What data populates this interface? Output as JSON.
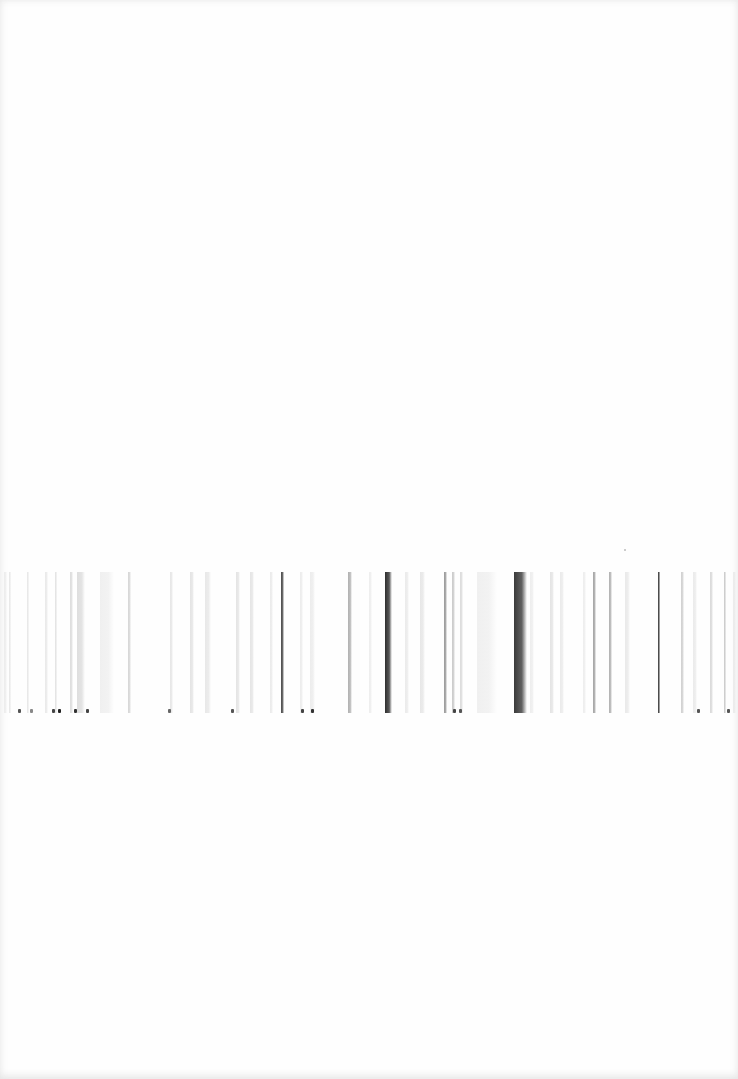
{
  "page": {
    "background": "#fefefe"
  },
  "strip": {
    "top": 572,
    "height": 141,
    "lines": [
      {
        "x": 4,
        "w": 3,
        "color": "#e6e6e6",
        "opacity": 0.7
      },
      {
        "x": 9,
        "w": 2,
        "color": "#d8d8d8",
        "opacity": 0.6
      },
      {
        "x": 27,
        "w": 2,
        "color": "#dcdcdc",
        "opacity": 0.7
      },
      {
        "x": 45,
        "w": 3,
        "color": "#e0e0e0",
        "opacity": 0.7
      },
      {
        "x": 55,
        "w": 2,
        "color": "#cfcfcf",
        "opacity": 0.6
      },
      {
        "x": 70,
        "w": 3,
        "color": "#d4d4d4",
        "opacity": 0.8
      },
      {
        "x": 77,
        "w": 8,
        "color": "#c8c8c8",
        "opacity": 0.6
      },
      {
        "x": 100,
        "w": 14,
        "color": "#eeeeee",
        "opacity": 0.9
      },
      {
        "x": 128,
        "w": 3,
        "color": "#cccccc",
        "opacity": 0.8
      },
      {
        "x": 170,
        "w": 3,
        "color": "#dcdcdc",
        "opacity": 0.7
      },
      {
        "x": 190,
        "w": 4,
        "color": "#d8d8d8",
        "opacity": 0.7
      },
      {
        "x": 205,
        "w": 6,
        "color": "#e2e2e2",
        "opacity": 0.8
      },
      {
        "x": 236,
        "w": 4,
        "color": "#dddddd",
        "opacity": 0.8
      },
      {
        "x": 250,
        "w": 4,
        "color": "#dadada",
        "opacity": 0.7
      },
      {
        "x": 270,
        "w": 3,
        "color": "#e2e2e2",
        "opacity": 0.7
      },
      {
        "x": 281,
        "w": 3,
        "color": "#4a4a4a",
        "opacity": 1.0
      },
      {
        "x": 300,
        "w": 3,
        "color": "#e4e4e4",
        "opacity": 0.7
      },
      {
        "x": 310,
        "w": 5,
        "color": "#e8e8e8",
        "opacity": 0.8
      },
      {
        "x": 348,
        "w": 4,
        "color": "#a8a8a8",
        "opacity": 0.9
      },
      {
        "x": 369,
        "w": 3,
        "color": "#e6e6e6",
        "opacity": 0.7
      },
      {
        "x": 385,
        "w": 7,
        "color": "#2e2e2e",
        "opacity": 1.0
      },
      {
        "x": 405,
        "w": 4,
        "color": "#e2e2e2",
        "opacity": 0.7
      },
      {
        "x": 420,
        "w": 5,
        "color": "#dddddd",
        "opacity": 0.7
      },
      {
        "x": 444,
        "w": 3,
        "color": "#8e8e8e",
        "opacity": 0.9
      },
      {
        "x": 452,
        "w": 3,
        "color": "#bdbdbd",
        "opacity": 0.8
      },
      {
        "x": 460,
        "w": 3,
        "color": "#cccccc",
        "opacity": 0.7
      },
      {
        "x": 477,
        "w": 20,
        "color": "#eeeeee",
        "opacity": 0.9
      },
      {
        "x": 514,
        "w": 13,
        "color": "#3a3a3a",
        "opacity": 1.0
      },
      {
        "x": 530,
        "w": 4,
        "color": "#e6e6e6",
        "opacity": 0.7
      },
      {
        "x": 550,
        "w": 4,
        "color": "#dddddd",
        "opacity": 0.8
      },
      {
        "x": 560,
        "w": 4,
        "color": "#e2e2e2",
        "opacity": 0.7
      },
      {
        "x": 583,
        "w": 3,
        "color": "#e6e6e6",
        "opacity": 0.7
      },
      {
        "x": 593,
        "w": 3,
        "color": "#9a9a9a",
        "opacity": 0.9
      },
      {
        "x": 609,
        "w": 3,
        "color": "#a8a8a8",
        "opacity": 0.9
      },
      {
        "x": 625,
        "w": 5,
        "color": "#e4e4e4",
        "opacity": 0.8
      },
      {
        "x": 658,
        "w": 2,
        "color": "#3c3c3c",
        "opacity": 1.0
      },
      {
        "x": 681,
        "w": 3,
        "color": "#c4c4c4",
        "opacity": 0.8
      },
      {
        "x": 693,
        "w": 4,
        "color": "#e2e2e2",
        "opacity": 0.7
      },
      {
        "x": 710,
        "w": 3,
        "color": "#d0d0d0",
        "opacity": 0.8
      },
      {
        "x": 724,
        "w": 2,
        "color": "#bcbcbc",
        "opacity": 0.8
      },
      {
        "x": 733,
        "w": 3,
        "color": "#e4e4e4",
        "opacity": 0.7
      }
    ],
    "base_specks": [
      {
        "x": 18,
        "color": "#555555"
      },
      {
        "x": 30,
        "color": "#888888"
      },
      {
        "x": 52,
        "color": "#444444"
      },
      {
        "x": 58,
        "color": "#222222"
      },
      {
        "x": 74,
        "color": "#333333"
      },
      {
        "x": 86,
        "color": "#444444"
      },
      {
        "x": 168,
        "color": "#666666"
      },
      {
        "x": 231,
        "color": "#555555"
      },
      {
        "x": 301,
        "color": "#444444"
      },
      {
        "x": 311,
        "color": "#333333"
      },
      {
        "x": 453,
        "color": "#444444"
      },
      {
        "x": 459,
        "color": "#555555"
      },
      {
        "x": 697,
        "color": "#555555"
      },
      {
        "x": 727,
        "color": "#555555"
      }
    ]
  },
  "specks": [
    {
      "x": 624,
      "y": 549,
      "color": "#bbbbbb"
    }
  ]
}
